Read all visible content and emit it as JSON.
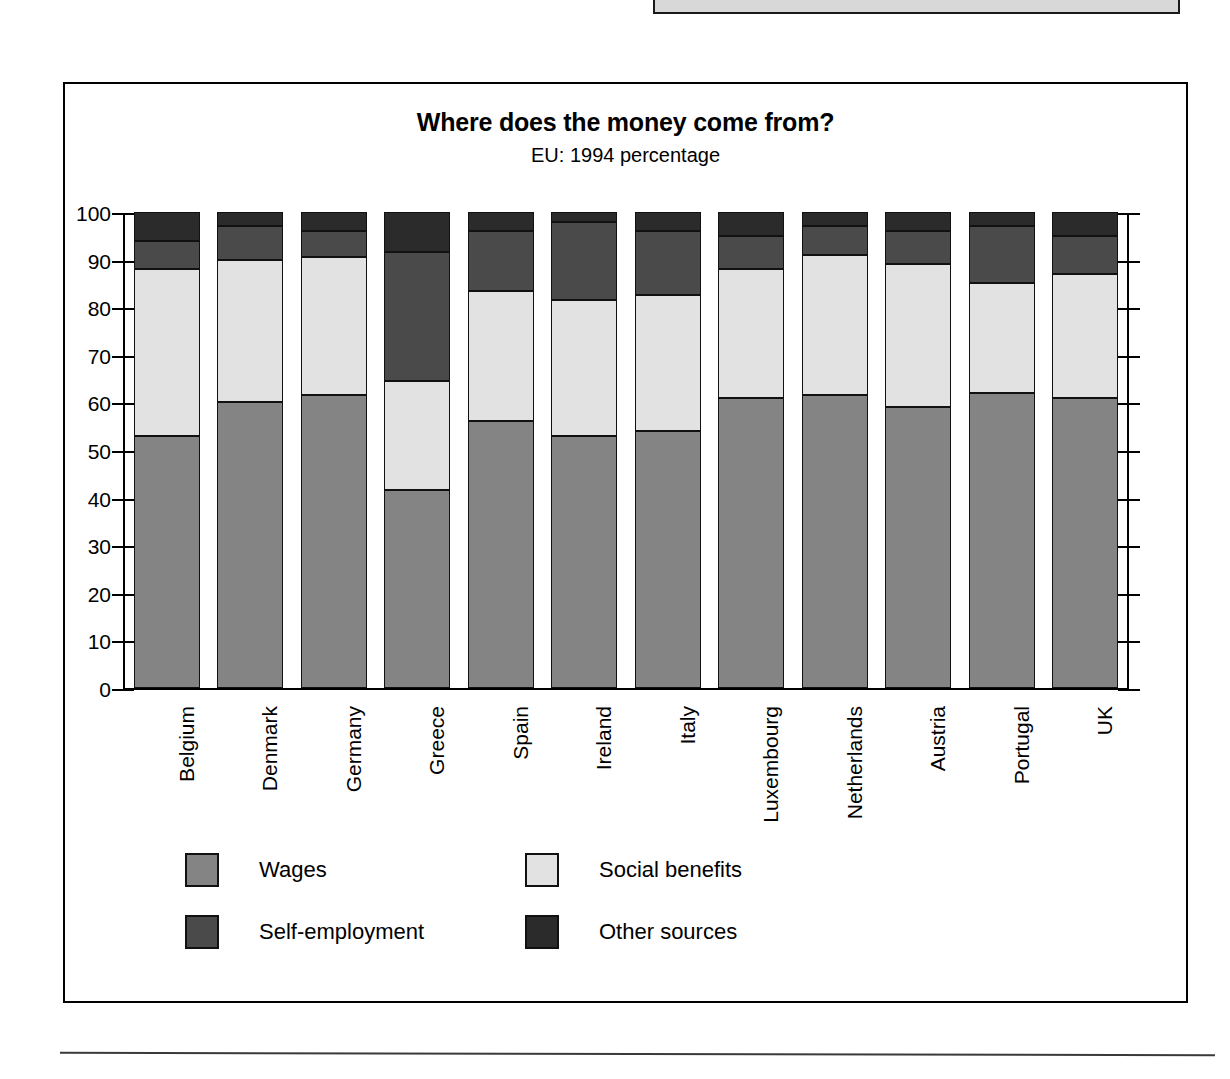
{
  "figure": {
    "title": "Where does the money come from?",
    "subtitle": "EU: 1994 percentage"
  },
  "legend": [
    {
      "label": "Wages",
      "color": "#848484",
      "key": "wages"
    },
    {
      "label": "Social benefits",
      "color": "#e2e2e2",
      "key": "social"
    },
    {
      "label": "Self-employment",
      "color": "#4a4a4a",
      "key": "self"
    },
    {
      "label": "Other sources",
      "color": "#2b2b2b",
      "key": "other"
    }
  ],
  "chart_data": {
    "type": "bar",
    "stacked": true,
    "title": "Where does the money come from?",
    "subtitle": "EU: 1994 percentage",
    "xlabel": "",
    "ylabel": "",
    "ylim": [
      0,
      100
    ],
    "yticks": [
      0,
      10,
      20,
      30,
      40,
      50,
      60,
      70,
      80,
      90,
      100
    ],
    "grid": false,
    "legend_position": "bottom-left",
    "categories": [
      "Belgium",
      "Denmark",
      "Germany",
      "Greece",
      "Spain",
      "Ireland",
      "Italy",
      "Luxembourg",
      "Netherlands",
      "Austria",
      "Portugal",
      "UK"
    ],
    "series": [
      {
        "name": "Wages",
        "color": "#848484",
        "values": [
          53,
          60,
          61.5,
          41.5,
          56,
          53,
          54,
          61,
          61.5,
          59,
          62,
          61
        ]
      },
      {
        "name": "Social benefits",
        "color": "#e2e2e2",
        "values": [
          35,
          30,
          29,
          23,
          27.5,
          28.5,
          28.5,
          27,
          29.5,
          30,
          23,
          26
        ]
      },
      {
        "name": "Self-employment",
        "color": "#4a4a4a",
        "values": [
          6,
          7,
          5.5,
          27,
          12.5,
          16.5,
          13.5,
          7,
          6,
          7,
          12,
          8
        ]
      },
      {
        "name": "Other sources",
        "color": "#2b2b2b",
        "values": [
          6,
          3,
          4,
          8.5,
          4,
          2,
          4,
          5,
          3,
          4,
          3,
          5
        ]
      }
    ]
  }
}
